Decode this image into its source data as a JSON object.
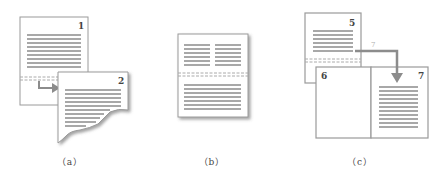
{
  "figure": {
    "panels": [
      {
        "id": "a",
        "caption": "（a）",
        "pages": [
          "1",
          "2"
        ],
        "description": "Continuous section break: text flows from page 1 to torn page 2"
      },
      {
        "id": "b",
        "caption": "（b）",
        "pages": [],
        "description": "Single page with two-column section above break and one-column section below"
      },
      {
        "id": "c",
        "caption": "（c）",
        "pages": [
          "5",
          "6",
          "7"
        ],
        "arrow_label": "7",
        "description": "Odd page section break: text jumps from page 5 to page 7, page 6 left blank"
      }
    ],
    "colors": {
      "page_border": "#9a9a9a",
      "text_line": "#a8a8a8",
      "arrow": "#8c8c8c",
      "break_line": "#aaaaaa",
      "shadow": "#777777"
    }
  }
}
